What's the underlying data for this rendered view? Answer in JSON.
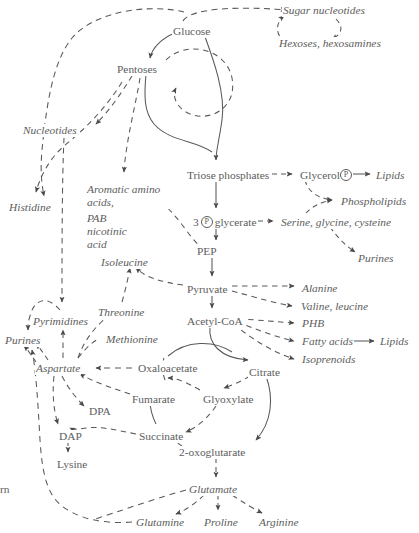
{
  "diagram": {
    "text_color": "#5d5d5d",
    "background": "#ffffff",
    "nodes": [
      {
        "id": "sugar_nucleotides",
        "label": "Sugar nucleotides",
        "style": "italic",
        "x": 282,
        "y": 4
      },
      {
        "id": "hexoses",
        "label": "Hexoses, hexosamines",
        "style": "italic",
        "x": 278,
        "y": 37
      },
      {
        "id": "glucose",
        "label": "Glucose",
        "style": "roman",
        "x": 172,
        "y": 25
      },
      {
        "id": "pentoses",
        "label": "Pentoses",
        "style": "roman",
        "x": 116,
        "y": 63
      },
      {
        "id": "nucleotides",
        "label": "Nucleotides",
        "style": "italic",
        "x": 22,
        "y": 124
      },
      {
        "id": "histidine",
        "label": "Histidine",
        "style": "italic",
        "x": 8,
        "y": 201
      },
      {
        "id": "aromatic",
        "label": "Aromatic amino acids,",
        "style": "italic",
        "x": 86,
        "y": 183
      },
      {
        "id": "pab",
        "label": "PAB nicotinic acid",
        "style": "italic",
        "x": 86,
        "y": 213
      },
      {
        "id": "triose",
        "label": "Triose phosphates",
        "style": "roman",
        "x": 186,
        "y": 169
      },
      {
        "id": "glycerol",
        "label": "Glycerol",
        "style": "roman",
        "suffix": "P",
        "x": 299,
        "y": 169
      },
      {
        "id": "lipids_top",
        "label": "Lipids",
        "style": "italic",
        "x": 375,
        "y": 169
      },
      {
        "id": "phospholipids",
        "label": "Phospholipids",
        "style": "italic",
        "x": 340,
        "y": 195
      },
      {
        "id": "glycerate",
        "label": "glycerate",
        "prefix": "3",
        "style": "roman",
        "x": 196,
        "y": 216
      },
      {
        "id": "serine",
        "label": "Serine, glycine, cysteine",
        "style": "italic",
        "x": 280,
        "y": 216
      },
      {
        "id": "purines_right",
        "label": "Purines",
        "style": "italic",
        "x": 357,
        "y": 252
      },
      {
        "id": "pep",
        "label": "PEP",
        "style": "roman",
        "x": 196,
        "y": 245
      },
      {
        "id": "isoleucine",
        "label": "Isoleucine",
        "style": "italic",
        "x": 100,
        "y": 256
      },
      {
        "id": "pyruvate",
        "label": "Pyruvate",
        "style": "roman",
        "x": 186,
        "y": 283
      },
      {
        "id": "alanine",
        "label": "Alanine",
        "style": "italic",
        "x": 301,
        "y": 282
      },
      {
        "id": "valine",
        "label": "Valine, leucine",
        "style": "italic",
        "x": 300,
        "y": 302
      },
      {
        "id": "acetylcoa",
        "label": "Acetyl-CoA",
        "style": "roman",
        "x": 186,
        "y": 315
      },
      {
        "id": "phb",
        "label": "PHB",
        "style": "italic",
        "x": 301,
        "y": 319
      },
      {
        "id": "fatty",
        "label": "Fatty acids",
        "style": "italic",
        "x": 301,
        "y": 337
      },
      {
        "id": "lipids_right",
        "label": "Lipids",
        "style": "italic",
        "x": 379,
        "y": 337
      },
      {
        "id": "isoprenoids",
        "label": "Isoprenoids",
        "style": "italic",
        "x": 301,
        "y": 355
      },
      {
        "id": "threonine",
        "label": "Threonine",
        "style": "italic",
        "x": 97,
        "y": 306
      },
      {
        "id": "pyrimidines",
        "label": "Pyrimidines",
        "style": "italic",
        "x": 32,
        "y": 315
      },
      {
        "id": "methionine",
        "label": "Methionine",
        "style": "italic",
        "x": 105,
        "y": 333
      },
      {
        "id": "purines_left",
        "label": "Purines",
        "style": "italic",
        "x": 4,
        "y": 334
      },
      {
        "id": "aspartate",
        "label": "Aspartate",
        "style": "italic",
        "x": 35,
        "y": 363
      },
      {
        "id": "oxaloacetate",
        "label": "Oxaloacetate",
        "style": "roman",
        "x": 137,
        "y": 363
      },
      {
        "id": "citrate",
        "label": "Citrate",
        "style": "roman",
        "x": 248,
        "y": 366
      },
      {
        "id": "fumarate",
        "label": "Fumarate",
        "style": "roman",
        "x": 131,
        "y": 394
      },
      {
        "id": "glyoxylate",
        "label": "Glyoxylate",
        "style": "roman",
        "x": 202,
        "y": 394
      },
      {
        "id": "dpa",
        "label": "DPA",
        "style": "roman",
        "x": 88,
        "y": 406
      },
      {
        "id": "dap",
        "label": "DAP",
        "style": "roman",
        "x": 60,
        "y": 431
      },
      {
        "id": "succinate",
        "label": "Succinate",
        "style": "roman",
        "x": 138,
        "y": 431
      },
      {
        "id": "oxoglutarate",
        "label": "2-oxoglutarate",
        "style": "roman",
        "x": 178,
        "y": 447
      },
      {
        "id": "lysine",
        "label": "Lysine",
        "style": "roman",
        "x": 58,
        "y": 459
      },
      {
        "id": "glutamate",
        "label": "Glutamate",
        "style": "italic",
        "x": 188,
        "y": 484
      },
      {
        "id": "glutamine",
        "label": "Glutamine",
        "style": "italic",
        "x": 135,
        "y": 517
      },
      {
        "id": "proline",
        "label": "Proline",
        "style": "italic",
        "x": 203,
        "y": 517
      },
      {
        "id": "arginine",
        "label": "Arginine",
        "style": "italic",
        "x": 258,
        "y": 517
      },
      {
        "id": "edge_fragment",
        "label": "rn",
        "style": "roman",
        "x": 0,
        "y": 484
      }
    ],
    "edges": [
      {
        "from": "glucose",
        "to": "sugar_nucleotides",
        "style": "dashed"
      },
      {
        "from": "sugar_nucleotides",
        "to": "hexoses",
        "style": "dashed"
      },
      {
        "from": "hexoses",
        "to": "sugar_nucleotides",
        "style": "dashed"
      },
      {
        "from": "glucose",
        "to": "pentoses",
        "style": "solid"
      },
      {
        "from": "glucose",
        "to": "triose",
        "style": "solid"
      },
      {
        "from": "pentoses",
        "to": "triose",
        "style": "solid"
      },
      {
        "from": "triose",
        "to": "pentoses",
        "style": "dashed"
      },
      {
        "from": "pentoses",
        "to": "nucleotides",
        "style": "dashed"
      },
      {
        "from": "pentoses",
        "to": "aromatic",
        "style": "dashed"
      },
      {
        "from": "nucleotides",
        "to": "histidine",
        "style": "dashed"
      },
      {
        "from": "pentoses",
        "to": "histidine",
        "style": "dashed"
      },
      {
        "from": "triose",
        "to": "glycerol",
        "style": "dashed"
      },
      {
        "from": "glycerol",
        "to": "lipids_top",
        "style": "solid"
      },
      {
        "from": "glycerol",
        "to": "phospholipids",
        "style": "dashed"
      },
      {
        "from": "triose",
        "to": "glycerate",
        "style": "solid"
      },
      {
        "from": "glycerate",
        "to": "serine",
        "style": "dashed"
      },
      {
        "from": "serine",
        "to": "phospholipids",
        "style": "dashed"
      },
      {
        "from": "serine",
        "to": "purines_right",
        "style": "dashed"
      },
      {
        "from": "glycerate",
        "to": "pep",
        "style": "solid"
      },
      {
        "from": "aromatic",
        "to": "pep",
        "style": "dashed"
      },
      {
        "from": "pep",
        "to": "pyruvate",
        "style": "solid"
      },
      {
        "from": "pyruvate",
        "to": "isoleucine",
        "style": "dashed"
      },
      {
        "from": "pyruvate",
        "to": "alanine",
        "style": "dashed"
      },
      {
        "from": "pyruvate",
        "to": "valine",
        "style": "dashed"
      },
      {
        "from": "pyruvate",
        "to": "acetylcoa",
        "style": "solid"
      },
      {
        "from": "acetylcoa",
        "to": "phb",
        "style": "dashed"
      },
      {
        "from": "acetylcoa",
        "to": "fatty",
        "style": "dashed"
      },
      {
        "from": "fatty",
        "to": "lipids_right",
        "style": "solid"
      },
      {
        "from": "acetylcoa",
        "to": "isoprenoids",
        "style": "dashed"
      },
      {
        "from": "acetylcoa",
        "to": "citrate",
        "style": "solid"
      },
      {
        "from": "oxaloacetate",
        "to": "citrate",
        "style": "solid"
      },
      {
        "from": "oxaloacetate",
        "to": "aspartate",
        "style": "dashed"
      },
      {
        "from": "aspartate",
        "to": "threonine",
        "style": "dashed"
      },
      {
        "from": "aspartate",
        "to": "methionine",
        "style": "dashed"
      },
      {
        "from": "threonine",
        "to": "isoleucine",
        "style": "dashed"
      },
      {
        "from": "aspartate",
        "to": "pyrimidines",
        "style": "dashed"
      },
      {
        "from": "pyrimidines",
        "to": "purines_left",
        "style": "dashed"
      },
      {
        "from": "aspartate",
        "to": "purines_left",
        "style": "dashed"
      },
      {
        "from": "nucleotides",
        "to": "pyrimidines",
        "style": "dashed"
      },
      {
        "from": "aspartate",
        "to": "dpa",
        "style": "dashed"
      },
      {
        "from": "aspartate",
        "to": "dap",
        "style": "dashed"
      },
      {
        "from": "dpa",
        "to": "dap",
        "style": "dashed"
      },
      {
        "from": "dap",
        "to": "lysine",
        "style": "dashed"
      },
      {
        "from": "citrate",
        "to": "oxoglutarate",
        "style": "solid"
      },
      {
        "from": "citrate",
        "to": "glyoxylate",
        "style": "dashed"
      },
      {
        "from": "glyoxylate",
        "to": "succinate",
        "style": "dashed"
      },
      {
        "from": "oxoglutarate",
        "to": "succinate",
        "style": "dashed"
      },
      {
        "from": "succinate",
        "to": "fumarate",
        "style": "solid"
      },
      {
        "from": "fumarate",
        "to": "aspartate",
        "style": "dashed"
      },
      {
        "from": "succinate",
        "to": "dap",
        "style": "dashed"
      },
      {
        "from": "oxoglutarate",
        "to": "glutamate",
        "style": "dashed"
      },
      {
        "from": "glutamate",
        "to": "glutamine",
        "style": "dashed"
      },
      {
        "from": "glutamate",
        "to": "proline",
        "style": "dashed"
      },
      {
        "from": "glutamate",
        "to": "arginine",
        "style": "dashed"
      },
      {
        "from": "glutamine",
        "to": "purines_left",
        "style": "dashed"
      }
    ]
  }
}
